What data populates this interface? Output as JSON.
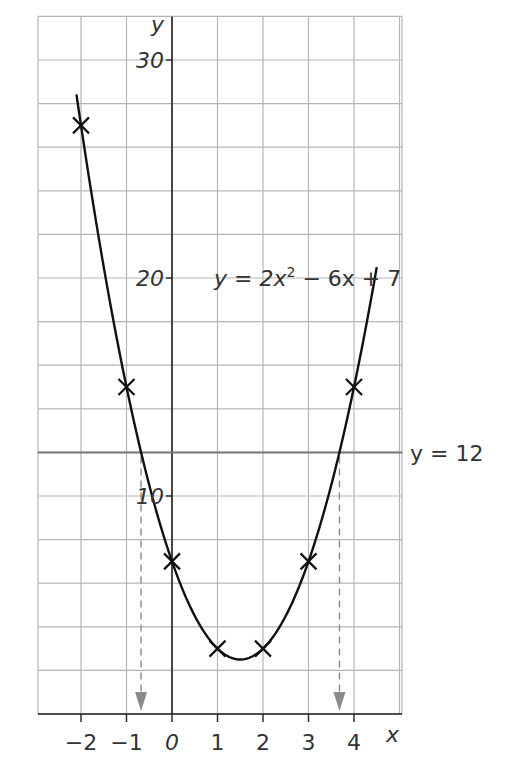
{
  "chart_data": {
    "type": "line",
    "title": "",
    "equation_label": "y = 2x² − 6x + 7",
    "equation_parts": {
      "lhs": "y = 2x",
      "sup": "2",
      "rhs": " − 6x + 7"
    },
    "xlabel": "x",
    "ylabel": "y",
    "xlim": [
      -2.9,
      5.0
    ],
    "ylim": [
      0,
      32
    ],
    "x_ticks": [
      -2,
      -1,
      0,
      1,
      2,
      3,
      4
    ],
    "x_tick_labels": [
      "−2",
      "−1",
      "0",
      "1",
      "2",
      "3",
      "4"
    ],
    "y_ticks": [
      10,
      20,
      30
    ],
    "y_tick_labels": [
      "10",
      "20",
      "30"
    ],
    "grid": true,
    "grid_x_step": 1,
    "grid_y_step": 2,
    "series": [
      {
        "name": "y = 2x² − 6x + 7",
        "type": "curve",
        "x": [
          -2,
          -1,
          0,
          1,
          2,
          3,
          4
        ],
        "y": [
          27,
          15,
          7,
          3,
          3,
          7,
          15
        ],
        "marker": "x",
        "curve_domain": [
          -2.1,
          4.5
        ]
      }
    ],
    "horizontal_line": {
      "y": 12,
      "label": "y = 12"
    },
    "annotations": [
      {
        "type": "dashed-arrow",
        "x": -0.68,
        "from_y": 12,
        "to_y": 0
      },
      {
        "type": "dashed-arrow",
        "x": 3.68,
        "from_y": 12,
        "to_y": 0
      }
    ],
    "colors": {
      "curve": "#111111",
      "grid": "#b5b5b5",
      "axis": "#222222",
      "line_y12": "#777777",
      "arrow": "#8a8a8a"
    }
  }
}
